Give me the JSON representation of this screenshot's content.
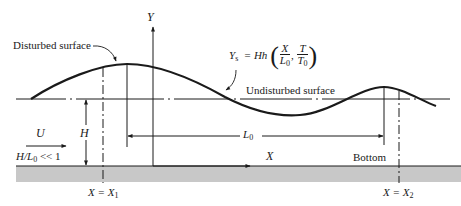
{
  "labels": {
    "y_axis": "Y",
    "x_axis": "X",
    "disturbed_surface": "Disturbed surface",
    "undisturbed_surface": "Undisturbed surface",
    "bottom": "Bottom",
    "velocity": "U",
    "height": "H",
    "wavelength": "L",
    "wavelength_sub": "0",
    "ratio_lhs": "H/L",
    "ratio_sub": "0",
    "ratio_rhs": "<< 1",
    "x1_lhs": "X = X",
    "x1_sub": "1",
    "x2_lhs": "X = X",
    "x2_sub": "2"
  },
  "equation": {
    "lhs": "Y",
    "lhs_sub": "s",
    "equals": "= Hh",
    "frac1_num": "X",
    "frac1_den": "L",
    "frac1_den_sub": "0",
    "comma": ",",
    "frac2_num": "T",
    "frac2_den": "T",
    "frac2_den_sub": "0",
    "open_paren": "(",
    "close_paren": ")"
  },
  "colors": {
    "line": "#1a1a1a",
    "bottom_fill": "#c8c8c8",
    "background": "#ffffff"
  }
}
